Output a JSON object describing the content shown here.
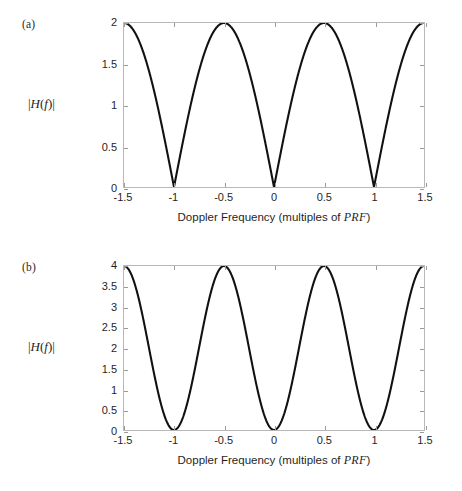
{
  "figure": {
    "background": "#ffffff",
    "curve_color": "#111111",
    "axis_color": "#b8b8b8",
    "panels": [
      {
        "tag": "(a)",
        "ylabel": "|H(f)|",
        "xlabel_prefix": "Doppler Frequency (multiples of ",
        "xlabel_math": "PRF",
        "xlabel_suffix": ")",
        "xticks": [
          "-1.5",
          "-1",
          "-0.5",
          "0",
          "0.5",
          "1",
          "1.5"
        ],
        "yticks": [
          "0",
          "0.5",
          "1",
          "1.5",
          "2"
        ]
      },
      {
        "tag": "(b)",
        "ylabel": "|H(f)|",
        "xlabel_prefix": "Doppler Frequency (multiples of ",
        "xlabel_math": "PRF",
        "xlabel_suffix": ")",
        "xticks": [
          "-1.5",
          "-1",
          "-0.5",
          "0",
          "0.5",
          "1",
          "1.5"
        ],
        "yticks": [
          "0",
          "0.5",
          "1",
          "1.5",
          "2",
          "2.5",
          "3",
          "3.5",
          "4"
        ]
      }
    ]
  },
  "chart_data": [
    {
      "type": "line",
      "panel": "(a)",
      "title": "",
      "xlabel": "Doppler Frequency (multiples of PRF)",
      "ylabel": "|H(f)|",
      "xlim": [
        -1.5,
        1.5
      ],
      "ylim": [
        0,
        2
      ],
      "xticks": [
        -1.5,
        -1,
        -0.5,
        0,
        0.5,
        1,
        1.5
      ],
      "yticks": [
        0,
        0.5,
        1,
        1.5,
        2
      ],
      "grid": false,
      "legend": "none",
      "formula": "|H(f)| = 2*|sin(pi*f/PRF)|",
      "series": [
        {
          "name": "single-delay canceller",
          "x": [
            -1.5,
            -1.45,
            -1.4,
            -1.35,
            -1.3,
            -1.25,
            -1.2,
            -1.15,
            -1.1,
            -1.05,
            -1.0,
            -0.95,
            -0.9,
            -0.85,
            -0.8,
            -0.75,
            -0.7,
            -0.65,
            -0.6,
            -0.55,
            -0.5,
            -0.45,
            -0.4,
            -0.35,
            -0.3,
            -0.25,
            -0.2,
            -0.15,
            -0.1,
            -0.05,
            0.0,
            0.05,
            0.1,
            0.15,
            0.2,
            0.25,
            0.3,
            0.35,
            0.4,
            0.45,
            0.5,
            0.55,
            0.6,
            0.65,
            0.7,
            0.75,
            0.8,
            0.85,
            0.9,
            0.95,
            1.0,
            1.05,
            1.1,
            1.15,
            1.2,
            1.25,
            1.3,
            1.35,
            1.4,
            1.45,
            1.5
          ],
          "y": [
            2.0,
            1.988,
            1.951,
            1.891,
            1.809,
            1.707,
            1.588,
            1.453,
            1.307,
            1.151,
            0.0,
            0.313,
            0.618,
            0.908,
            1.176,
            1.414,
            1.618,
            1.782,
            1.902,
            1.975,
            2.0,
            1.975,
            1.902,
            1.782,
            1.618,
            1.414,
            1.176,
            0.908,
            0.618,
            0.313,
            0.0,
            0.313,
            0.618,
            0.908,
            1.176,
            1.414,
            1.618,
            1.782,
            1.902,
            1.975,
            2.0,
            1.975,
            1.902,
            1.782,
            1.618,
            1.414,
            1.176,
            0.908,
            0.618,
            0.313,
            0.0,
            0.313,
            0.618,
            0.908,
            1.176,
            1.414,
            1.618,
            1.782,
            1.902,
            1.975,
            2.0
          ]
        }
      ],
      "nulls": [
        -1,
        0,
        1
      ],
      "peaks": [
        {
          "x": -1.5,
          "y": 2
        },
        {
          "x": -0.5,
          "y": 2
        },
        {
          "x": 0.5,
          "y": 2
        },
        {
          "x": 1.5,
          "y": 2
        }
      ]
    },
    {
      "type": "line",
      "panel": "(b)",
      "title": "",
      "xlabel": "Doppler Frequency (multiples of PRF)",
      "ylabel": "|H(f)|",
      "xlim": [
        -1.5,
        1.5
      ],
      "ylim": [
        0,
        4
      ],
      "xticks": [
        -1.5,
        -1,
        -0.5,
        0,
        0.5,
        1,
        1.5
      ],
      "yticks": [
        0,
        0.5,
        1,
        1.5,
        2,
        2.5,
        3,
        3.5,
        4
      ],
      "grid": false,
      "legend": "none",
      "formula": "|H(f)| = 4*sin^2(pi*f/PRF)",
      "series": [
        {
          "name": "double-delay canceller",
          "x": [
            -1.5,
            -1.45,
            -1.4,
            -1.35,
            -1.3,
            -1.25,
            -1.2,
            -1.15,
            -1.1,
            -1.05,
            -1.0,
            -0.95,
            -0.9,
            -0.85,
            -0.8,
            -0.75,
            -0.7,
            -0.65,
            -0.6,
            -0.55,
            -0.5,
            -0.45,
            -0.4,
            -0.35,
            -0.3,
            -0.25,
            -0.2,
            -0.15,
            -0.1,
            -0.05,
            0.0,
            0.05,
            0.1,
            0.15,
            0.2,
            0.25,
            0.3,
            0.35,
            0.4,
            0.45,
            0.5,
            0.55,
            0.6,
            0.65,
            0.7,
            0.75,
            0.8,
            0.85,
            0.9,
            0.95,
            1.0,
            1.05,
            1.1,
            1.15,
            1.2,
            1.25,
            1.3,
            1.35,
            1.4,
            1.45,
            1.5
          ],
          "y": [
            4.0,
            3.951,
            3.809,
            3.578,
            3.273,
            2.914,
            2.524,
            2.112,
            1.708,
            1.325,
            0.0,
            0.098,
            0.382,
            0.824,
            1.382,
            2.0,
            2.618,
            3.176,
            3.618,
            3.902,
            4.0,
            3.902,
            3.618,
            3.176,
            2.618,
            2.0,
            1.382,
            0.824,
            0.382,
            0.098,
            0.0,
            0.098,
            0.382,
            0.824,
            1.382,
            2.0,
            2.618,
            3.176,
            3.618,
            3.902,
            4.0,
            3.902,
            3.618,
            3.176,
            2.618,
            2.0,
            1.382,
            0.824,
            0.382,
            0.098,
            0.0,
            0.098,
            0.382,
            0.824,
            1.382,
            2.0,
            2.618,
            3.176,
            3.618,
            3.902,
            4.0
          ]
        }
      ],
      "nulls": [
        -1,
        0,
        1
      ],
      "peaks": [
        {
          "x": -1.5,
          "y": 4
        },
        {
          "x": -0.5,
          "y": 4
        },
        {
          "x": 0.5,
          "y": 4
        },
        {
          "x": 1.5,
          "y": 4
        }
      ]
    }
  ]
}
